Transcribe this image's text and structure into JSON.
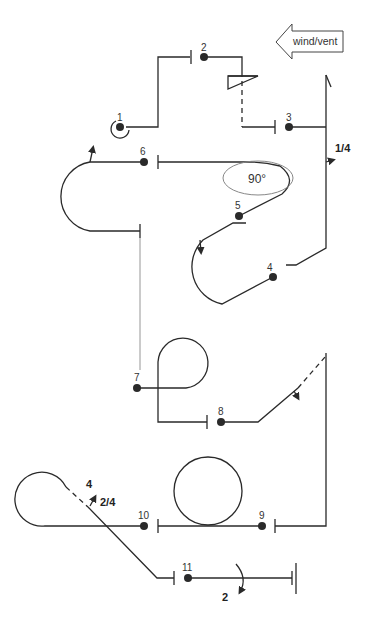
{
  "diagram": {
    "wind_label": "wind/vent",
    "angle_label": "90°",
    "marks": [
      {
        "id": "1",
        "label": "1"
      },
      {
        "id": "2",
        "label": "2"
      },
      {
        "id": "3",
        "label": "3"
      },
      {
        "id": "4",
        "label": "4"
      },
      {
        "id": "5",
        "label": "5"
      },
      {
        "id": "6",
        "label": "6"
      },
      {
        "id": "7",
        "label": "7"
      },
      {
        "id": "8",
        "label": "8"
      },
      {
        "id": "9",
        "label": "9"
      },
      {
        "id": "10",
        "label": "10"
      },
      {
        "id": "11",
        "label": "11"
      }
    ],
    "turn_labels": {
      "quarter_at_3": "1/4",
      "four_loop": "4",
      "two_quarter": "2/4",
      "two_at_11": "2"
    }
  }
}
